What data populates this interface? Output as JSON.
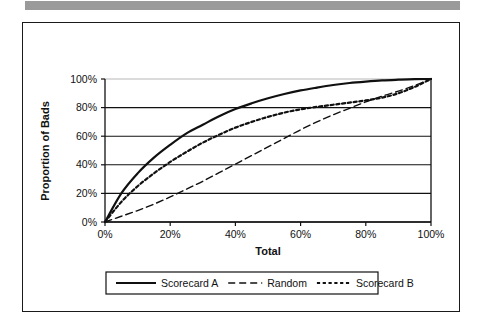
{
  "figure": {
    "top_band_color": "#9a9a9a",
    "frame_color": "#1a1a1a",
    "background": "#ffffff"
  },
  "chart_data": {
    "type": "line",
    "title": "",
    "xlabel": "Total",
    "ylabel": "Proportion of Bads",
    "xlim": [
      0,
      100
    ],
    "ylim": [
      0,
      100
    ],
    "grid": "horizontal",
    "legend_position": "bottom",
    "xticks": [
      "0%",
      "20%",
      "40%",
      "60%",
      "80%",
      "100%"
    ],
    "yticks": [
      "0%",
      "20%",
      "40%",
      "60%",
      "80%",
      "100%"
    ],
    "xtick_values": [
      0,
      20,
      40,
      60,
      80,
      100
    ],
    "ytick_values": [
      0,
      20,
      40,
      60,
      80,
      100
    ],
    "x": [
      0,
      5,
      10,
      15,
      20,
      25,
      30,
      35,
      40,
      45,
      50,
      55,
      60,
      65,
      70,
      75,
      80,
      85,
      90,
      95,
      100
    ],
    "series": [
      {
        "name": "Scorecard A",
        "style": "solid",
        "color": "#101010",
        "width": 2.2,
        "values": [
          0,
          20,
          34,
          45,
          54,
          62,
          68,
          74,
          79,
          83,
          86.5,
          89.5,
          92,
          94,
          95.8,
          97.2,
          98.2,
          99,
          99.5,
          99.9,
          100
        ]
      },
      {
        "name": "Random",
        "style": "dashed",
        "color": "#101010",
        "width": 1.4,
        "values": [
          0,
          4,
          8,
          12.5,
          17.5,
          23,
          28.5,
          34.5,
          40.5,
          46.5,
          52.5,
          58.5,
          64.5,
          70,
          75,
          79.5,
          84,
          88,
          91.5,
          95.5,
          100
        ]
      },
      {
        "name": "Scorecard B",
        "style": "dotted",
        "color": "#101010",
        "width": 2.2,
        "values": [
          0,
          14,
          25,
          34,
          42,
          49,
          55.5,
          61,
          66,
          70,
          73.5,
          76.5,
          78.8,
          80.5,
          82,
          83.5,
          85,
          87,
          90,
          94.5,
          100
        ]
      }
    ]
  },
  "legend": {
    "items": [
      {
        "label": "Scorecard A",
        "style": "solid"
      },
      {
        "label": "Random",
        "style": "dashed"
      },
      {
        "label": "Scorecard B",
        "style": "dotted"
      }
    ]
  }
}
